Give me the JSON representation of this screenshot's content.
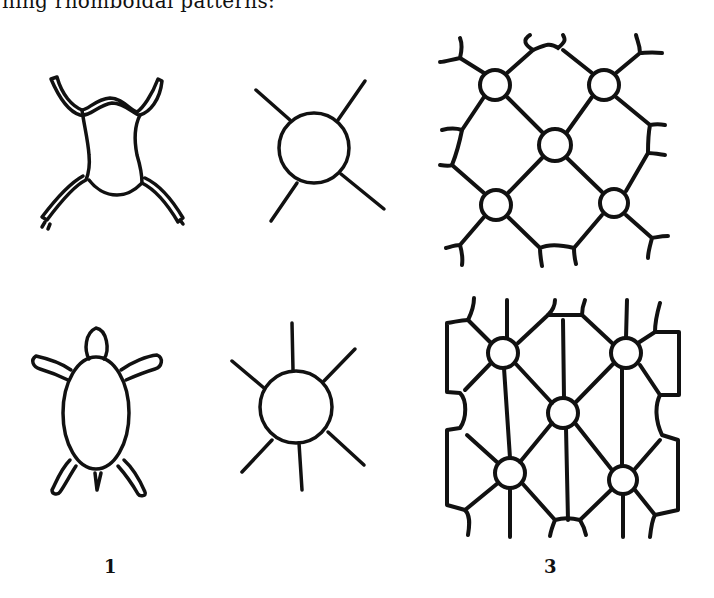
{
  "page": {
    "top_text_fragment": "hing rhomboidal patterns:",
    "figures": [
      {
        "label": "1",
        "description": "Frog and turtle motifs with sun/star circle motifs"
      },
      {
        "label": "3",
        "description": "Lattice patterns of circles joined by lines"
      }
    ]
  },
  "colors": {
    "ink": "#111111",
    "paper": "#ffffff"
  }
}
